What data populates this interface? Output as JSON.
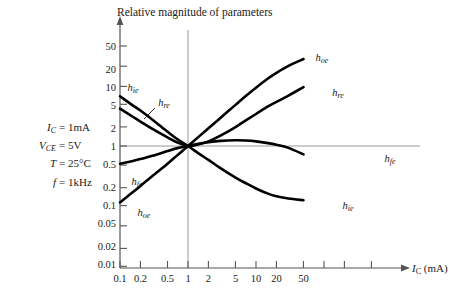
{
  "chart_data": {
    "type": "line",
    "title": "Relative magnitude of parameters",
    "xlabel": "I_C (mA)",
    "ylabel": "Relative magnitude of parameters",
    "xscale": "log",
    "yscale": "log",
    "xlim": [
      0.1,
      80
    ],
    "ylim": [
      0.01,
      80
    ],
    "grid": false,
    "reference_lines": {
      "x": 1,
      "y": 1
    },
    "xticks": [
      "0.1",
      "0.2",
      "0.5",
      "1",
      "2",
      "5",
      "10",
      "20",
      "50"
    ],
    "xtick_values": [
      0.1,
      0.2,
      0.5,
      1,
      2,
      5,
      10,
      20,
      50
    ],
    "yticks": [
      "50",
      "20",
      "10",
      "5",
      "2",
      "1",
      "0.5",
      "0.2",
      "0.1",
      "0.05",
      "0.02",
      "0.01"
    ],
    "ytick_values": [
      50,
      20,
      10,
      5,
      2,
      1,
      0.5,
      0.2,
      0.1,
      0.05,
      0.02,
      0.01
    ],
    "legend_position": "inline-labels",
    "series": [
      {
        "name": "h_oe",
        "label": "h",
        "sub": "oe",
        "x": [
          0.1,
          0.15,
          0.2,
          0.3,
          0.5,
          0.7,
          1,
          1.5,
          2,
          3,
          5,
          7,
          10,
          15,
          20,
          30,
          50
        ],
        "values": [
          0.11,
          0.16,
          0.21,
          0.31,
          0.5,
          0.7,
          1.0,
          1.5,
          2.0,
          3.0,
          5.0,
          7.0,
          9.8,
          14.0,
          17.5,
          23.0,
          30.0
        ]
      },
      {
        "name": "h_re",
        "label": "h",
        "sub": "re",
        "x": [
          0.1,
          0.15,
          0.2,
          0.3,
          0.5,
          0.7,
          1,
          1.5,
          2,
          3,
          5,
          7,
          10,
          15,
          20,
          30,
          50
        ],
        "values": [
          4.3,
          3.2,
          2.6,
          1.95,
          1.4,
          1.15,
          1.0,
          1.08,
          1.2,
          1.5,
          2.1,
          2.7,
          3.5,
          4.7,
          5.6,
          7.2,
          10.0
        ]
      },
      {
        "name": "h_fe",
        "label": "h",
        "sub": "fe",
        "x": [
          0.1,
          0.15,
          0.2,
          0.3,
          0.5,
          0.7,
          1,
          1.5,
          2,
          3,
          5,
          7,
          10,
          15,
          20,
          30,
          50
        ],
        "values": [
          0.5,
          0.55,
          0.6,
          0.68,
          0.82,
          0.92,
          1.0,
          1.1,
          1.16,
          1.22,
          1.25,
          1.24,
          1.2,
          1.12,
          1.05,
          0.93,
          0.72
        ]
      },
      {
        "name": "h_ie",
        "label": "h",
        "sub": "ie",
        "x": [
          0.1,
          0.15,
          0.2,
          0.3,
          0.5,
          0.7,
          1,
          1.5,
          2,
          3,
          5,
          7,
          10,
          15,
          20,
          30,
          50
        ],
        "values": [
          7.0,
          5.0,
          4.0,
          2.8,
          1.75,
          1.3,
          1.0,
          0.72,
          0.58,
          0.42,
          0.29,
          0.235,
          0.19,
          0.155,
          0.14,
          0.128,
          0.12
        ]
      }
    ],
    "curve_labels": [
      {
        "name": "h_ie_left",
        "label": "h",
        "sub": "ie",
        "x_px": 133,
        "y_px": 88
      },
      {
        "name": "h_re_left",
        "label": "h",
        "sub": "re",
        "x_px": 164,
        "y_px": 103
      },
      {
        "name": "h_fe_left",
        "label": "h",
        "sub": "fe",
        "x_px": 137,
        "y_px": 182
      },
      {
        "name": "h_oe_left",
        "label": "h",
        "sub": "oe",
        "x_px": 144,
        "y_px": 213
      },
      {
        "name": "h_oe_right",
        "label": "h",
        "sub": "oe",
        "x_px": 322,
        "y_px": 58
      },
      {
        "name": "h_re_right",
        "label": "h",
        "sub": "re",
        "x_px": 338,
        "y_px": 93
      },
      {
        "name": "h_fe_right",
        "label": "h",
        "sub": "fe",
        "x_px": 390,
        "y_px": 159
      },
      {
        "name": "h_ie_right",
        "label": "h",
        "sub": "ie",
        "x_px": 348,
        "y_px": 206
      }
    ],
    "annotations": {
      "conditions": [
        {
          "name": "ic",
          "symbol": "I",
          "sub": "C",
          "eq": "=",
          "value": "1mA"
        },
        {
          "name": "vce",
          "symbol": "V",
          "sub": "CE",
          "eq": "=",
          "value": "5V"
        },
        {
          "name": "temp",
          "symbol": "T",
          "sub": "",
          "eq": "=",
          "value": "25°C"
        },
        {
          "name": "freq",
          "symbol": "f",
          "sub": "",
          "eq": "=",
          "value": "1kHz"
        }
      ]
    },
    "colors": {
      "curve": "#000000",
      "axis": "#4a4a4a",
      "reference_line": "#9a9a9a",
      "text": "#1a1a1a",
      "background": "#ffffff"
    }
  }
}
